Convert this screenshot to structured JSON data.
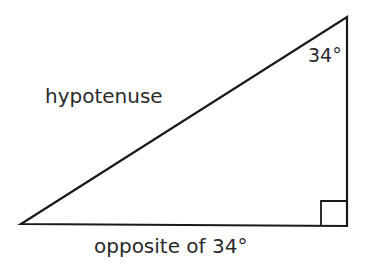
{
  "diagram": {
    "type": "right-triangle",
    "line_color": "#1a1a1a",
    "text_color": "#2a2a2a",
    "vertices": {
      "left": [
        21,
        224
      ],
      "right_angle": [
        347,
        226
      ],
      "top": [
        347,
        17
      ]
    },
    "labels": {
      "angle": "34°",
      "hypotenuse": "hypotenuse",
      "base": "opposite of 34°"
    }
  }
}
